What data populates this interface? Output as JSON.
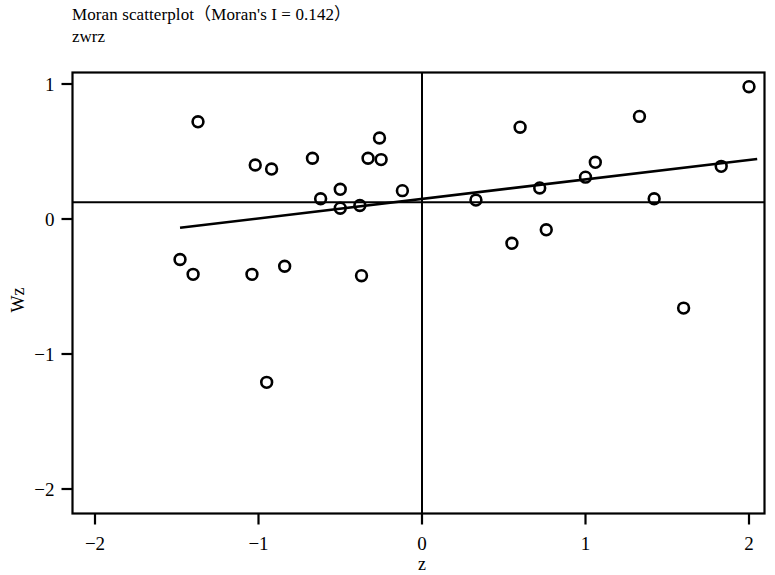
{
  "chart_data": {
    "type": "scatter",
    "title": "Moran scatterplot（Moran's I = 0.142）",
    "subtitle": "zwrz",
    "xlabel": "z",
    "ylabel": "Wz",
    "xlim": [
      -2.12,
      2.1
    ],
    "ylim": [
      -2.1,
      1.12
    ],
    "xticks": [
      -2,
      -1,
      0,
      1,
      2
    ],
    "xtick_labels": [
      "−2",
      "−1",
      "0",
      "1",
      "2"
    ],
    "yticks": [
      1,
      0,
      -1,
      -2
    ],
    "ytick_labels": [
      "1",
      "0",
      "−1",
      "−2"
    ],
    "grid": false,
    "legend": null,
    "morans_i": 0.142,
    "marker": "open-circle",
    "points": [
      {
        "x": -1.48,
        "y": -0.3
      },
      {
        "x": -1.37,
        "y": 0.72
      },
      {
        "x": -1.4,
        "y": -0.41
      },
      {
        "x": -1.02,
        "y": 0.4
      },
      {
        "x": -0.92,
        "y": 0.37
      },
      {
        "x": -1.04,
        "y": -0.41
      },
      {
        "x": -0.95,
        "y": -1.21
      },
      {
        "x": -0.84,
        "y": -0.35
      },
      {
        "x": -0.67,
        "y": 0.45
      },
      {
        "x": -0.62,
        "y": 0.15
      },
      {
        "x": -0.5,
        "y": 0.08
      },
      {
        "x": -0.5,
        "y": 0.22
      },
      {
        "x": -0.38,
        "y": 0.1
      },
      {
        "x": -0.37,
        "y": -0.42
      },
      {
        "x": -0.33,
        "y": 0.45
      },
      {
        "x": -0.26,
        "y": 0.6
      },
      {
        "x": -0.25,
        "y": 0.44
      },
      {
        "x": -0.12,
        "y": 0.21
      },
      {
        "x": 0.33,
        "y": 0.14
      },
      {
        "x": 0.55,
        "y": -0.18
      },
      {
        "x": 0.6,
        "y": 0.68
      },
      {
        "x": 0.72,
        "y": 0.23
      },
      {
        "x": 0.76,
        "y": -0.08
      },
      {
        "x": 1.0,
        "y": 0.31
      },
      {
        "x": 1.06,
        "y": 0.42
      },
      {
        "x": 1.33,
        "y": 0.76
      },
      {
        "x": 1.42,
        "y": 0.15
      },
      {
        "x": 1.6,
        "y": -0.66
      },
      {
        "x": 1.83,
        "y": 0.39
      },
      {
        "x": 2.0,
        "y": 0.98
      }
    ],
    "reference_lines": {
      "horizontal_mean": {
        "y": 0.125,
        "x_from": -2.12,
        "x_to": 2.1
      },
      "vertical_mean": {
        "x": 0.0,
        "y_from": -2.1,
        "y_to": 1.12
      }
    },
    "regression_line": {
      "x_from": -1.48,
      "y_from": -0.065,
      "x_to": 2.05,
      "y_to": 0.445,
      "slope": 0.1445,
      "intercept": 0.1489
    }
  }
}
